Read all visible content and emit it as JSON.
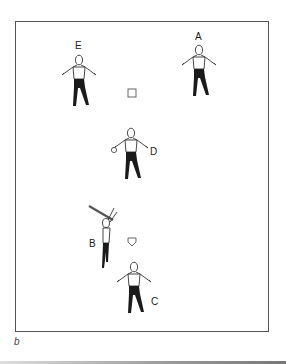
{
  "figure": {
    "panel_label": "b",
    "players": [
      {
        "id": "E",
        "label": "E"
      },
      {
        "id": "A",
        "label": "A"
      },
      {
        "id": "D",
        "label": "D"
      },
      {
        "id": "B",
        "label": "B"
      },
      {
        "id": "C",
        "label": "C"
      }
    ],
    "markers": [
      {
        "name": "second-base",
        "shape": "square"
      },
      {
        "name": "home-plate",
        "shape": "pentagon"
      }
    ],
    "colors": {
      "border": "#555555",
      "figure_line": "#333333",
      "pants": "#1a1a1a"
    }
  }
}
